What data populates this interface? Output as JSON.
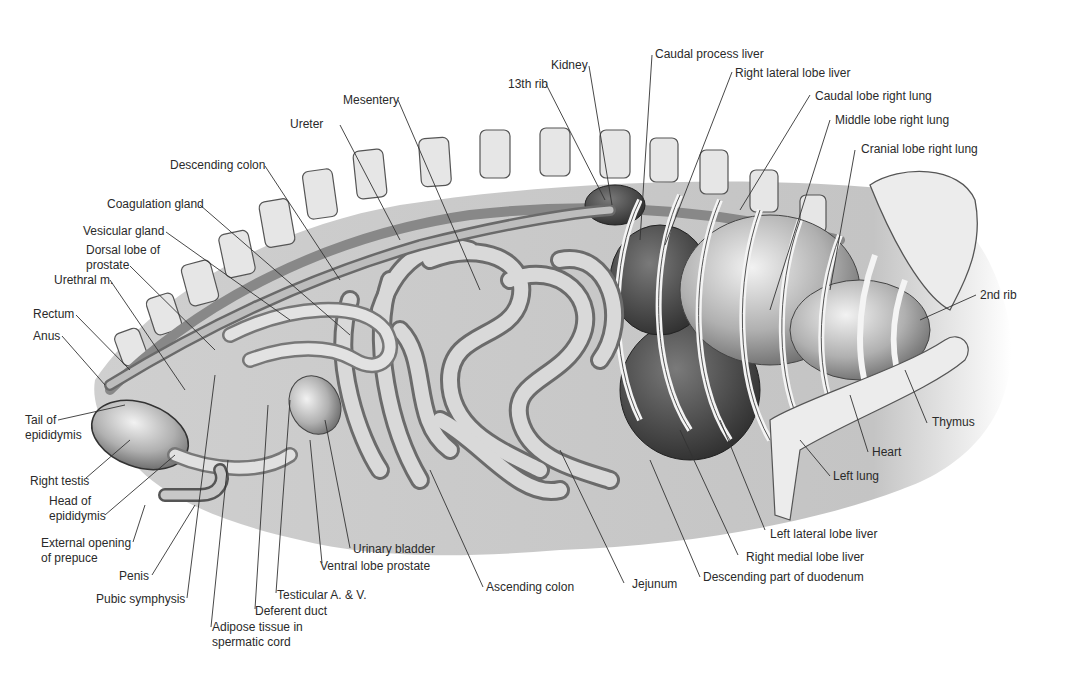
{
  "figure": {
    "colors": {
      "background": "#ffffff",
      "body_shadow": "#c8c8c8",
      "organ_light": "#e4e4e4",
      "organ_mid": "#a8a8a8",
      "organ_dark": "#4a4a4a",
      "leader_line": "#333333",
      "label_text": "#2a2a2a"
    }
  },
  "labels": {
    "kidney": "Kidney",
    "caudal_process_liver": "Caudal process liver",
    "thirteenth_rib": "13th rib",
    "right_lateral_lobe_liver": "Right lateral lobe liver",
    "mesentery": "Mesentery",
    "caudal_lobe_right_lung": "Caudal lobe right lung",
    "ureter": "Ureter",
    "middle_lobe_right_lung": "Middle lobe right lung",
    "cranial_lobe_right_lung": "Cranial lobe right lung",
    "descending_colon": "Descending colon",
    "coagulation_gland": "Coagulation gland",
    "vesicular_gland": "Vesicular gland",
    "dorsal_lobe_prostate_1": "Dorsal lobe of",
    "dorsal_lobe_prostate_2": "prostate",
    "urethral_m": "Urethral m.",
    "second_rib": "2nd rib",
    "rectum": "Rectum",
    "anus": "Anus",
    "tail_epididymis_1": "Tail of",
    "tail_epididymis_2": "epididymis",
    "thymus": "Thymus",
    "heart": "Heart",
    "right_testis": "Right testis",
    "head_epididymis_1": "Head of",
    "head_epididymis_2": "epididymis",
    "left_lung": "Left lung",
    "external_opening_1": "External opening",
    "external_opening_2": "of prepuce",
    "left_lateral_lobe_liver": "Left lateral lobe liver",
    "urinary_bladder": "Urinary bladder",
    "right_medial_lobe_liver": "Right medial lobe liver",
    "ventral_lobe_prostate": "Ventral lobe prostate",
    "penis": "Penis",
    "descending_duodenum": "Descending part of duodenum",
    "ascending_colon": "Ascending colon",
    "jejunum": "Jejunum",
    "pubic_symphysis": "Pubic symphysis",
    "testicular_av": "Testicular A. & V.",
    "deferent_duct": "Deferent duct",
    "adipose_1": "Adipose tissue in",
    "adipose_2": "spermatic cord"
  }
}
